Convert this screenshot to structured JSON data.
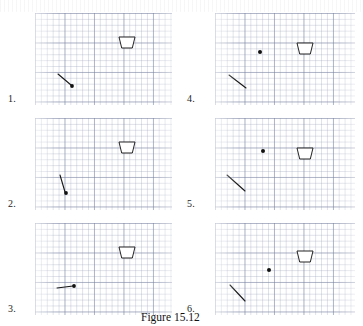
{
  "figure": {
    "caption": "Figure 15.12",
    "panel_count": 6
  },
  "panels": [
    {
      "number": "1.",
      "label_x": 8,
      "label_y": 94,
      "box": {
        "x": 35,
        "y": 13,
        "w": 137,
        "h": 92
      },
      "cup": {
        "x": 84,
        "y": 24,
        "w": 16,
        "h": 11
      },
      "projectile": {
        "x": 37,
        "y": 73,
        "r": 1.9
      },
      "vector": {
        "x1": 23,
        "y1": 61,
        "x2": 36,
        "y2": 72
      },
      "description": "launch point low-left, velocity vector points down-right toward the dot"
    },
    {
      "number": "2.",
      "label_x": 8,
      "label_y": 199,
      "box": {
        "x": 35,
        "y": 118,
        "w": 137,
        "h": 92
      },
      "cup": {
        "x": 84,
        "y": 24,
        "w": 16,
        "h": 11
      },
      "projectile": {
        "x": 31,
        "y": 75,
        "r": 1.9
      },
      "vector": {
        "x1": 25,
        "y1": 57,
        "x2": 30,
        "y2": 74
      },
      "description": "steep downward velocity vector ending at the dot"
    },
    {
      "number": "3.",
      "label_x": 8,
      "label_y": 304,
      "box": {
        "x": 35,
        "y": 223,
        "w": 137,
        "h": 92
      },
      "cup": {
        "x": 84,
        "y": 24,
        "w": 16,
        "h": 11
      },
      "projectile": {
        "x": 39,
        "y": 63,
        "r": 1.9
      },
      "vector": {
        "x1": 22,
        "y1": 65,
        "x2": 38,
        "y2": 63
      },
      "description": "nearly horizontal velocity vector pointing right to the dot"
    },
    {
      "number": "4.",
      "label_x": 187,
      "label_y": 94,
      "box": {
        "x": 215,
        "y": 13,
        "w": 140,
        "h": 92
      },
      "cup": {
        "x": 82,
        "y": 30,
        "w": 16,
        "h": 11
      },
      "projectile": {
        "x": 45,
        "y": 39,
        "r": 2.0
      },
      "vector": {
        "x1": 14,
        "y1": 62,
        "x2": 31,
        "y2": 75
      },
      "description": "dot separated from a detached diagonal velocity vector below-left"
    },
    {
      "number": "5.",
      "label_x": 187,
      "label_y": 199,
      "box": {
        "x": 215,
        "y": 118,
        "w": 140,
        "h": 92
      },
      "cup": {
        "x": 82,
        "y": 30,
        "w": 16,
        "h": 11
      },
      "projectile": {
        "x": 48,
        "y": 33,
        "r": 2.0
      },
      "vector": {
        "x1": 12,
        "y1": 57,
        "x2": 30,
        "y2": 73
      },
      "description": "dot higher, detached diagonal velocity vector lower-left"
    },
    {
      "number": "6.",
      "label_x": 187,
      "label_y": 304,
      "box": {
        "x": 215,
        "y": 223,
        "w": 140,
        "h": 92
      },
      "cup": {
        "x": 82,
        "y": 28,
        "w": 16,
        "h": 11
      },
      "projectile": {
        "x": 54,
        "y": 47,
        "r": 2.0
      },
      "vector": {
        "x1": 15,
        "y1": 62,
        "x2": 30,
        "y2": 78
      },
      "description": "dot to the left of the cup, detached diagonal vector lower-left"
    }
  ],
  "colors": {
    "ink": "#1a1a1a",
    "grid_major": "#7882a0",
    "grid_minor": "#969eb4",
    "paper": "#ffffff"
  },
  "chart_data": {
    "type": "scatter",
    "title": "Figure 15.12",
    "xlabel": "",
    "ylabel": "",
    "series": [
      {
        "name": "panel-1-projectile",
        "x": [
          37
        ],
        "y": [
          73
        ]
      },
      {
        "name": "panel-2-projectile",
        "x": [
          31
        ],
        "y": [
          75
        ]
      },
      {
        "name": "panel-3-projectile",
        "x": [
          39
        ],
        "y": [
          63
        ]
      },
      {
        "name": "panel-4-projectile",
        "x": [
          45
        ],
        "y": [
          39
        ]
      },
      {
        "name": "panel-5-projectile",
        "x": [
          48
        ],
        "y": [
          33
        ]
      },
      {
        "name": "panel-6-projectile",
        "x": [
          54
        ],
        "y": [
          47
        ]
      }
    ],
    "grid": true,
    "legend": "none"
  }
}
